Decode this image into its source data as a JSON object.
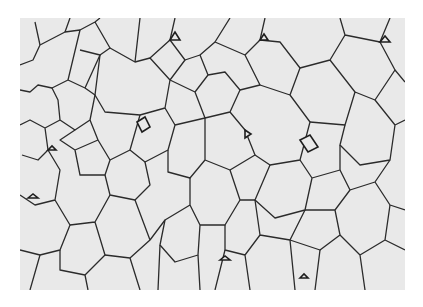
{
  "image": {
    "subject": "Two-dimensional soap foam: polygonal bubble cells separated by thin dark films",
    "palette": {
      "background": "#ffffff",
      "cell_fill": "#e8e8e8",
      "film": "#2a2a2a",
      "plateau_border": "#1a1a1a"
    },
    "frame": {
      "left": 20,
      "top": 18,
      "width": 385,
      "height": 272
    }
  }
}
